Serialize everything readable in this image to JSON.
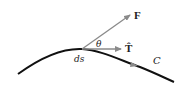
{
  "diagram": {
    "labels": {
      "force": "F",
      "tangent": "T̂",
      "angle": "θ",
      "arc_element": "ds",
      "curve": "C"
    },
    "colors": {
      "curve": "#111111",
      "vector": "#8a8a8a",
      "text": "#222222"
    }
  }
}
